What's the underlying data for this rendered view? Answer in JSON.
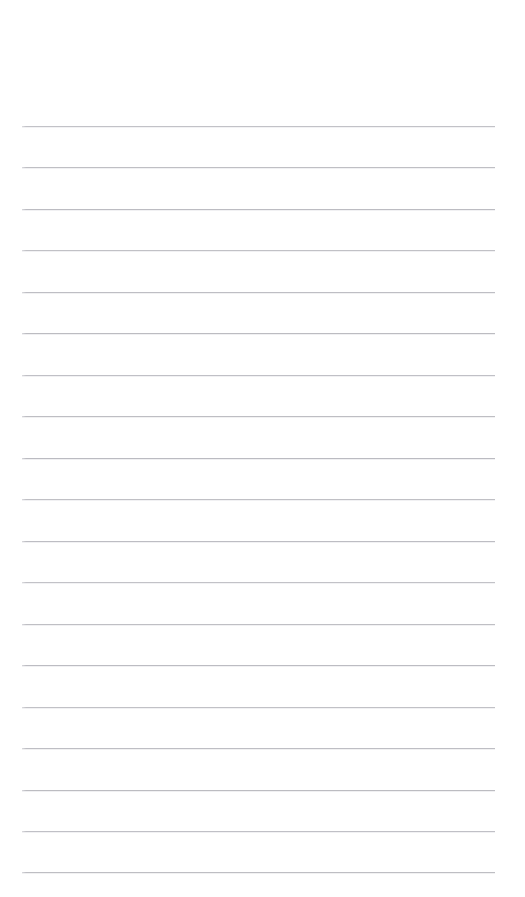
{
  "page": {
    "kind": "lined-paper-scan",
    "width_px": 525,
    "height_px": 897,
    "background_color": "#ffffff",
    "orientation": "portrait",
    "text_content": "",
    "has_handwriting": false,
    "has_printed_text": false
  },
  "ruling": {
    "line_count": 19,
    "line_color": "#babac0",
    "line_thickness_px": 1,
    "first_line_y_px": 126,
    "last_line_y_px": 872,
    "line_spacing_px": 41.4,
    "line_start_x_px": 22,
    "line_end_x_px": 495,
    "line_length_px": 473,
    "style": "single-ruled",
    "has_margin_rule": false,
    "has_header_rule": false,
    "lines_y_px": [
      126,
      167,
      209,
      250,
      292,
      333,
      375,
      416,
      458,
      499,
      541,
      582,
      624,
      665,
      707,
      748,
      790,
      831,
      872
    ]
  },
  "margins": {
    "top_px": 126,
    "bottom_px": 25,
    "left_px": 22,
    "right_px": 30,
    "top_label": "top margin",
    "bottom_label": "bottom margin",
    "left_label": "left margin",
    "right_label": "right margin"
  }
}
